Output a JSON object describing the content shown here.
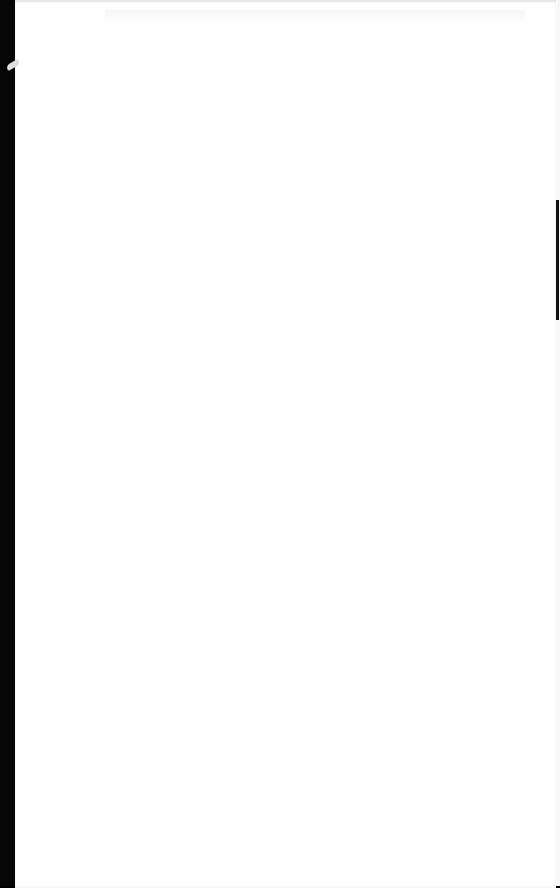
{
  "document": {
    "type": "scanned-page",
    "content": "",
    "colors": {
      "paper": "#ffffff",
      "background": "#000000"
    }
  }
}
